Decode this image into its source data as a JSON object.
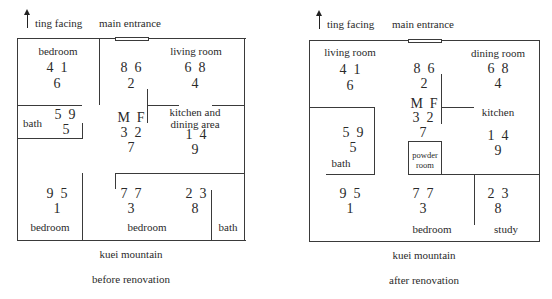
{
  "plans": [
    {
      "id": "before",
      "header": {
        "facing_label": "ting facing",
        "entrance_label": "main entrance"
      },
      "rooms": {
        "top_left": {
          "label": "bedroom",
          "stars": {
            "top": "4  1",
            "bottom": "6"
          }
        },
        "center_top": {
          "stars": {
            "top": "8  6",
            "bottom": "2"
          }
        },
        "top_right": {
          "label": "living room",
          "stars": {
            "top": "6  8",
            "bottom": "4"
          }
        },
        "bath_left": {
          "label": "bath",
          "stars": {
            "top": "5  9",
            "bottom": "5"
          }
        },
        "center": {
          "mf": "M  F",
          "stars": {
            "top": "3  2",
            "bottom": "7"
          }
        },
        "mid_right": {
          "label_line1": "kitchen and",
          "label_line2": "dining area",
          "stars": {
            "top": "1  4",
            "bottom": "9"
          }
        },
        "bottom_left": {
          "label": "bedroom",
          "stars": {
            "top": "9  5",
            "bottom": "1"
          }
        },
        "bottom_mid": {
          "label": "bedroom",
          "stars": {
            "top": "7  7",
            "bottom": "3"
          }
        },
        "bottom_right": {
          "stars": {
            "top": "2  3",
            "bottom": "8"
          }
        },
        "bath_right": {
          "label": "bath"
        }
      },
      "footer": {
        "mountain_label": "kuei mountain",
        "caption": "before renovation"
      }
    },
    {
      "id": "after",
      "header": {
        "facing_label": "ting facing",
        "entrance_label": "main entrance"
      },
      "rooms": {
        "top_left": {
          "label": "living room",
          "stars": {
            "top": "4  1",
            "bottom": "6"
          }
        },
        "center_top": {
          "stars": {
            "top": "8  6",
            "bottom": "2"
          }
        },
        "top_right": {
          "label": "dining room",
          "stars": {
            "top": "6  8",
            "bottom": "4"
          }
        },
        "center": {
          "mf": "M  F",
          "stars": {
            "top": "3  2",
            "bottom": "7"
          }
        },
        "mid_right": {
          "label": "kitchen",
          "stars": {
            "top": "1  4",
            "bottom": "9"
          }
        },
        "bath_left": {
          "label": "bath",
          "stars": {
            "top": "5  9",
            "bottom": "5"
          }
        },
        "powder_room": {
          "label_line1": "powder",
          "label_line2": "room"
        },
        "bottom_left": {
          "stars": {
            "top": "9  5",
            "bottom": "1"
          }
        },
        "bottom_mid": {
          "label": "bedroom",
          "stars": {
            "top": "7  7",
            "bottom": "3"
          }
        },
        "bottom_right": {
          "label": "study",
          "stars": {
            "top": "2  3",
            "bottom": "8"
          }
        }
      },
      "footer": {
        "mountain_label": "kuei mountain",
        "caption": "after renovation"
      }
    }
  ]
}
